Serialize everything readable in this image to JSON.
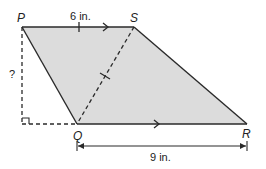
{
  "diagram": {
    "type": "geometry-figure",
    "shape": "parallelogram",
    "fill_color": "#dcdcdc",
    "stroke_color": "#2a2a2a",
    "vertices": [
      {
        "name": "P",
        "x": 22,
        "y": 27
      },
      {
        "name": "S",
        "x": 134,
        "y": 27
      },
      {
        "name": "R",
        "x": 247,
        "y": 124
      },
      {
        "name": "Q",
        "x": 77,
        "y": 124
      }
    ],
    "labels": {
      "P": "P",
      "S": "S",
      "Q": "Q",
      "R": "R",
      "top_length": "6 in.",
      "bottom_length": "9 in.",
      "height_unknown": "?"
    },
    "marks": {
      "parallel_arrows": [
        "PS",
        "QR"
      ],
      "congruent_ticks": [
        "PS",
        "SQ"
      ],
      "right_angle": "foot of height from P",
      "dashed_segments": [
        "P-height",
        "height-foot-to-Q",
        "SQ"
      ]
    }
  }
}
